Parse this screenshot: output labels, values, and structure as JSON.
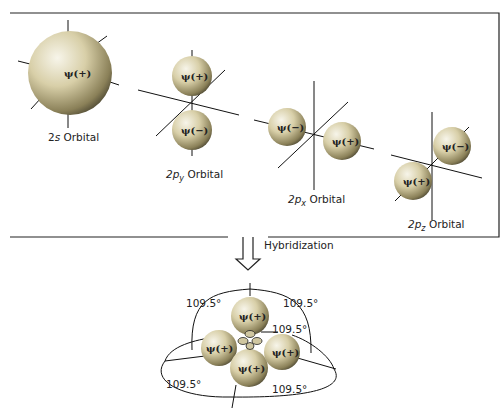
{
  "diagram": {
    "colors": {
      "lobe_light": "#f4f1e4",
      "lobe_mid": "#d9cfa4",
      "lobe_dark": "#6b6342",
      "line": "#111111",
      "background": "#ffffff"
    },
    "orbitals": [
      {
        "id": "2s",
        "label": "2s Orbital",
        "prefix": "2",
        "sub_letter": "s",
        "suffix": " Orbital",
        "lobes": [
          "ψ(+)"
        ]
      },
      {
        "id": "2py",
        "label": "2p_y Orbital",
        "prefix": "2p",
        "subscript": "y",
        "suffix": " Orbital",
        "lobes": [
          "ψ(+)",
          "ψ(−)"
        ]
      },
      {
        "id": "2px",
        "label": "2p_x Orbital",
        "prefix": "2p",
        "subscript": "x",
        "suffix": " Orbital",
        "lobes": [
          "ψ(−)",
          "ψ(+)"
        ]
      },
      {
        "id": "2pz",
        "label": "2p_z Orbital",
        "prefix": "2p",
        "subscript": "z",
        "suffix": " Orbital",
        "lobes": [
          "ψ(−)",
          "ψ(+)"
        ]
      }
    ],
    "arrow_label": "Hybridization",
    "hybrid": {
      "lobes": [
        "ψ(+)",
        "ψ(+)",
        "ψ(+)",
        "ψ(+)"
      ],
      "small_lobe_sign": "−",
      "angles": [
        "109.5°",
        "109.5°",
        "109.5°",
        "109.5°",
        "109.5°"
      ]
    }
  }
}
